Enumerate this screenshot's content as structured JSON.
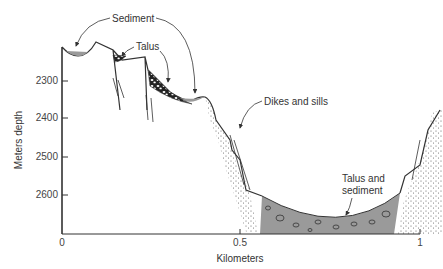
{
  "figure": {
    "type": "geologic cross-section",
    "y_axis": {
      "label": "Meters depth",
      "ticks": [
        "2300",
        "2400",
        "2500",
        "2600"
      ]
    },
    "x_axis": {
      "label": "Kilometers",
      "ticks": [
        "0",
        "0.5",
        "1"
      ]
    },
    "annotations": {
      "sediment": "Sediment",
      "talus": "Talus",
      "dikes": "Dikes and sills",
      "talus_sediment_line1": "Talus and",
      "talus_sediment_line2": "sediment"
    },
    "colors": {
      "sediment_fill": "#9a9a9a",
      "line": "#333333",
      "stipple": "#555555"
    }
  }
}
